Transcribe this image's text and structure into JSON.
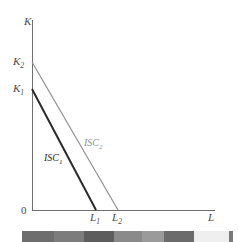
{
  "chart_data": {
    "type": "line",
    "title": "",
    "xlabel": "L",
    "ylabel": "K",
    "origin_label": "0",
    "xlim": [
      0,
      1
    ],
    "ylim": [
      0,
      1
    ],
    "grid": false,
    "legend": "inline-curve-labels",
    "axis_tick_labels": {
      "y": [
        "K_1",
        "K_2"
      ],
      "x": [
        "L_1",
        "L_2"
      ]
    },
    "annotations": [
      {
        "text": "ISC_1",
        "x": 0.34,
        "y": 0.3
      },
      {
        "text": "ISC_2",
        "x": 0.56,
        "y": 0.4
      }
    ],
    "series": [
      {
        "name": "ISC_1",
        "label": "ISC",
        "subscript": "1",
        "color": "#2b2b2b",
        "width": 2.0,
        "points": [
          {
            "x": 0.0,
            "y": 0.655
          },
          {
            "x": 0.351,
            "y": 0.0
          }
        ],
        "intercept_y_label": "K_1",
        "intercept_x_label": "L_1"
      },
      {
        "name": "ISC_2",
        "label": "ISC",
        "subscript": "2",
        "color": "#8f8f8f",
        "width": 1.2,
        "points": [
          {
            "x": 0.0,
            "y": 0.798
          },
          {
            "x": 0.472,
            "y": 0.0
          }
        ],
        "intercept_y_label": "K_2",
        "intercept_x_label": "L_2"
      }
    ]
  },
  "axes": {
    "y_axis_title": "K",
    "x_axis_title": "L",
    "origin": "0",
    "y_tick_1": "K",
    "y_tick_1_sub": "1",
    "y_tick_2": "K",
    "y_tick_2_sub": "2",
    "x_tick_1": "L",
    "x_tick_1_sub": "1",
    "x_tick_2": "L",
    "x_tick_2_sub": "2",
    "axis_color": "#6e6e6e"
  },
  "curves": {
    "isc1_label": "ISC",
    "isc1_sub": "1",
    "isc1_color": "#2b2b2b",
    "isc2_label": "ISC",
    "isc2_sub": "2",
    "isc2_color": "#8f8f8f"
  },
  "calibration_strip": {
    "name": "grayscale-calibration-bar",
    "segments": [
      {
        "color": "#ffffff",
        "width": 22
      },
      {
        "color": "#6d6d6d",
        "width": 32
      },
      {
        "color": "#7c7c7c",
        "width": 30
      },
      {
        "color": "#5d5d5d",
        "width": 30
      },
      {
        "color": "#8a8a8a",
        "width": 28
      },
      {
        "color": "#9a9a9a",
        "width": 22
      },
      {
        "color": "#6b6b6b",
        "width": 30
      },
      {
        "color": "#efefef",
        "width": 35
      },
      {
        "color": "#7a7a7a",
        "width": 4
      },
      {
        "color": "#ffffff",
        "width": 5
      }
    ]
  },
  "background_color": "#ffffff"
}
